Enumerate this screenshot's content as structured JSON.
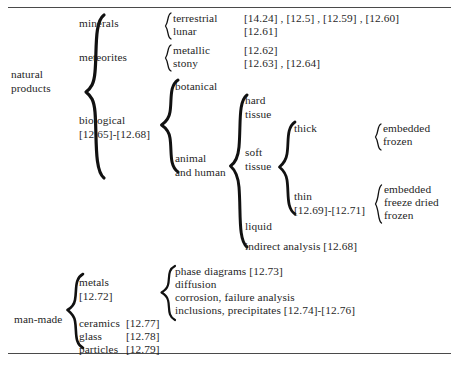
{
  "figure": {
    "type": "hierarchical-classification-tree"
  },
  "rules": {
    "top": "horizontal-rule-top",
    "bottom": "horizontal-rule-bottom"
  },
  "natural": {
    "root": "natural\nproducts",
    "branches": {
      "minerals": {
        "label": "minerals",
        "children": [
          {
            "label": "terrestrial",
            "refs": "[14.24] , [12.5] , [12.59] , [12.60]"
          },
          {
            "label": "lunar",
            "refs": "[12.61]"
          }
        ]
      },
      "meteorites": {
        "label": "meteorites",
        "children": [
          {
            "label": "metallic",
            "refs": "[12.62]"
          },
          {
            "label": "stony",
            "refs": "[12.63] , [12.64]"
          }
        ]
      },
      "biological": {
        "label": "biological\n[12.65]-[12.68]",
        "children": [
          {
            "label": "botanical"
          },
          {
            "label": "animal\nand human"
          }
        ]
      },
      "animal_human": {
        "label": "animal\nand human",
        "children": [
          {
            "label": "hard\ntissue"
          },
          {
            "label": "soft\ntissue"
          },
          {
            "label": "liquid"
          },
          {
            "label": "indirect analysis [12.68]"
          }
        ]
      },
      "soft_tissue": {
        "label": "soft\ntissue",
        "children": [
          {
            "label": "thick",
            "sub": [
              "embedded",
              "frozen"
            ]
          },
          {
            "label": "thin\n[12.69]-[12.71]",
            "sub": [
              "embedded",
              "freeze dried",
              "frozen"
            ]
          }
        ]
      }
    },
    "leaves": {
      "terrestrial": "terrestrial",
      "lunar": "lunar",
      "metallic": "metallic",
      "stony": "stony",
      "botanical": "botanical",
      "hard_tissue": "hard\ntissue",
      "soft_tissue": "soft\ntissue",
      "liquid": "liquid",
      "indirect_analysis": "indirect analysis [12.68]",
      "thick": "thick",
      "thin": "thin\n[12.69]-[12.71]",
      "thick_embedded": "embedded",
      "thick_frozen": "frozen",
      "thin_embedded": "embedded",
      "thin_freeze_dried": "freeze dried",
      "thin_frozen": "frozen"
    },
    "refs": {
      "minerals_terrestrial": "[14.24] , [12.5] , [12.59] , [12.60]",
      "minerals_lunar": "[12.61]",
      "meteorites_metallic": "[12.62]",
      "meteorites_stony": "[12.63] , [12.64]"
    }
  },
  "manmade": {
    "root": "man-made",
    "items": [
      {
        "label": "metals",
        "refs": "[12.72]"
      },
      {
        "label": "ceramics",
        "refs": "[12.77]"
      },
      {
        "label": "glass",
        "refs": "[12.78]"
      },
      {
        "label": "particles",
        "refs": "[12.79]"
      }
    ],
    "metals": {
      "label": "metals\n[12.72]",
      "children": [
        "phase diagrams [12.73]",
        "diffusion",
        "corrosion, failure analysis",
        "inclusions, precipitates [12.74]-[12.76]"
      ]
    },
    "leaves": {
      "metals": "metals\n[12.72]",
      "ceramics": "ceramics",
      "ceramics_ref": "[12.77]",
      "glass": "glass",
      "glass_ref": "[12.78]",
      "particles": "particles",
      "particles_ref": "[12.79]",
      "phase_diagrams": "phase diagrams [12.73]",
      "diffusion": "diffusion",
      "corrosion": "corrosion, failure analysis",
      "inclusions": "inclusions, precipitates [12.74]-[12.76]"
    }
  },
  "colors": {
    "background": "#ffffff",
    "text": "#1f1f1f",
    "rule": "#4a4a4a",
    "brace": "#111111"
  }
}
